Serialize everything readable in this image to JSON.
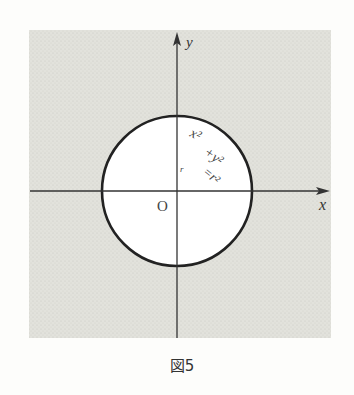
{
  "figure": {
    "caption": "図5",
    "axes": {
      "x_label": "x",
      "y_label": "y",
      "origin_label": "O"
    },
    "circle": {
      "equation_line1": "x²",
      "equation_line2": "+y²",
      "equation_line3": "=r²",
      "radius_label": "r"
    },
    "colors": {
      "shade": "#dcdcd6",
      "background": "#fdfdfb",
      "ink": "#222222",
      "circle_fill": "#ffffff"
    }
  }
}
